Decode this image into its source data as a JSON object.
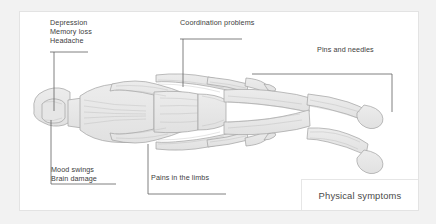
{
  "diagram": {
    "title": "Physical symptoms",
    "callouts": [
      {
        "id": "brain-top",
        "lines": [
          "Depression",
          "Memory loss",
          "Headache"
        ],
        "points_to": "head"
      },
      {
        "id": "coordination",
        "lines": [
          "Coordination problems"
        ],
        "points_to": "shoulder"
      },
      {
        "id": "pins-and-needles",
        "lines": [
          "Pins and needles"
        ],
        "points_to": "hand-and-foot"
      },
      {
        "id": "mood",
        "lines": [
          "Mood swings",
          "Brain damage"
        ],
        "points_to": "head"
      },
      {
        "id": "pains-limbs",
        "lines": [
          "Pains in the limbs"
        ],
        "points_to": "torso-limb"
      }
    ],
    "legend": {
      "label": "Physical symptoms"
    }
  },
  "colors": {
    "page_background": "#f2f2f2",
    "panel_background": "#ffffff",
    "panel_border": "#e3e3e3",
    "text": "#3d3d3d",
    "legend_text": "#4a4a4a",
    "leader_line": "#5a5a5a",
    "figure_fill": "#e8e8e8",
    "figure_stroke": "#9a9a9a"
  }
}
